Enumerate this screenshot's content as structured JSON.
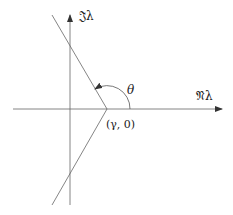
{
  "diagram": {
    "axes": {
      "imag_label": "𝔍λ",
      "real_label": "𝔑λ"
    },
    "vertex_label": "(γ, 0)",
    "angle_label": "θ",
    "colors": {
      "line": "#555555",
      "text": "#222222",
      "background": "#ffffff"
    }
  }
}
